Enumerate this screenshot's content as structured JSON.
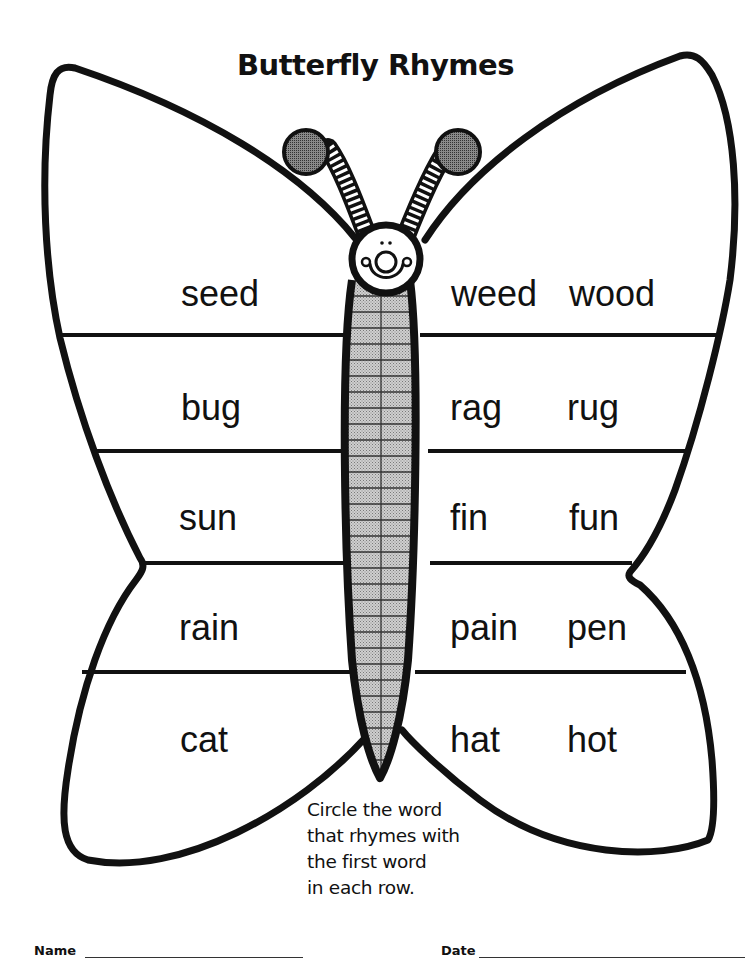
{
  "worksheet": {
    "title": "Butterfly Rhymes",
    "rows": [
      {
        "target": "seed",
        "choices": [
          "weed",
          "wood"
        ]
      },
      {
        "target": "bug",
        "choices": [
          "rag",
          "rug"
        ]
      },
      {
        "target": "sun",
        "choices": [
          "fin",
          "fun"
        ]
      },
      {
        "target": "rain",
        "choices": [
          "pain",
          "pen"
        ]
      },
      {
        "target": "cat",
        "choices": [
          "hat",
          "hot"
        ]
      }
    ],
    "instructions": [
      "Circle the word",
      "that rhymes with",
      "the first word",
      "in each row."
    ],
    "footer": {
      "name_label": "Name",
      "date_label": "Date"
    }
  },
  "illustration": {
    "subject": "butterfly",
    "icons": [
      "butterfly-left-wing",
      "butterfly-right-wing",
      "butterfly-body",
      "butterfly-face",
      "antenna-left",
      "antenna-right"
    ],
    "colors": {
      "outline": "#111111",
      "body_fill": "#bdbdbd",
      "antenna_tip": "#6a6a6a",
      "paper": "#ffffff"
    }
  }
}
